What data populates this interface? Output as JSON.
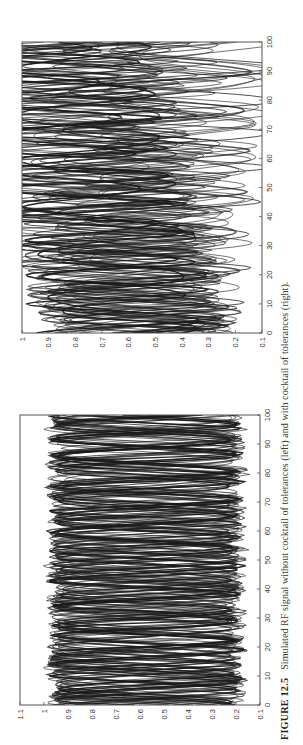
{
  "caption": {
    "label": "FIGURE 12.5",
    "text": "Simulated RF signal without cocktail of tolerances (left) and with cocktail of tolerances (right)."
  },
  "colors": {
    "trace": "#1a1a1a",
    "frame": "#555555",
    "background": "#ffffff"
  },
  "chart_data": [
    {
      "id": "left",
      "type": "line",
      "title": "Simulated RF signal without cocktail of tolerances",
      "xlabel": "",
      "ylabel": "",
      "xlim": [
        0,
        100
      ],
      "ylim": [
        0.1,
        1.1
      ],
      "x_ticks": [
        0,
        10,
        20,
        30,
        40,
        50,
        60,
        70,
        80,
        90,
        100
      ],
      "y_ticks": [
        0.1,
        0.2,
        0.3,
        0.4,
        0.5,
        0.6,
        0.7,
        0.8,
        0.9,
        1,
        1.1
      ],
      "y_tick_labels": [
        "0.1",
        "0.2",
        "0.3",
        "0.4",
        "0.5",
        "0.6",
        "0.7",
        "0.8",
        "0.9",
        "1",
        "1.1"
      ],
      "grid": false,
      "legend": "none",
      "orientation": "rotated 90 degrees counter-clockwise on page",
      "series_description": "Many overlapping sinusoidal RF traces forming a dense diamond/eye pattern",
      "signal_band": {
        "min": 0.17,
        "max": 0.98,
        "center": 0.575
      },
      "num_traces": 26,
      "period_range": [
        8,
        14
      ],
      "frame_px": {
        "left": 20,
        "top": 415,
        "right": 260,
        "bottom": 705
      }
    },
    {
      "id": "right",
      "type": "line",
      "title": "Simulated RF signal with cocktail of tolerances",
      "xlabel": "",
      "ylabel": "",
      "xlim": [
        0,
        100
      ],
      "ylim": [
        0.1,
        1.0
      ],
      "x_ticks": [
        0,
        10,
        20,
        30,
        40,
        50,
        60,
        70,
        80,
        90,
        100
      ],
      "y_ticks": [
        0.1,
        0.2,
        0.3,
        0.4,
        0.5,
        0.6,
        0.7,
        0.8,
        0.9,
        1
      ],
      "y_tick_labels": [
        "0.1",
        "0.2",
        "0.3",
        "0.4",
        "0.5",
        "0.6",
        "0.7",
        "0.8",
        "0.9",
        "1"
      ],
      "grid": false,
      "legend": "none",
      "orientation": "rotated 90 degrees counter-clockwise on page",
      "series_description": "Many overlapping sinusoidal RF traces with varied amplitude/offset due to tolerances",
      "signal_band": {
        "min": 0.22,
        "max": 0.92,
        "center": 0.57
      },
      "num_traces": 26,
      "period_range": [
        8,
        16
      ],
      "frame_px": {
        "left": 22,
        "top": 42,
        "right": 262,
        "bottom": 333
      }
    }
  ]
}
